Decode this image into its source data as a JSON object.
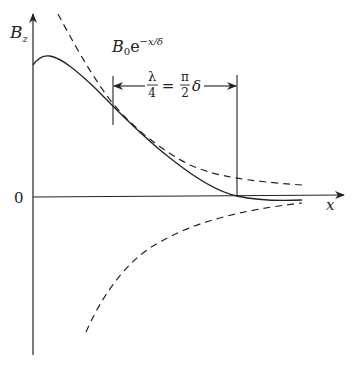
{
  "diagram": {
    "y_axis_label": "B",
    "y_axis_sub": "z",
    "x_axis_label": "x",
    "origin_label": "0",
    "envelope_label": {
      "base": "B",
      "sub": "0",
      "e": "e",
      "exp": "−x/δ"
    },
    "span_label": {
      "lhs_num": "λ",
      "lhs_den": "4",
      "eq": "=",
      "rhs_num": "π",
      "rhs_den": "2",
      "rhs_tail": "δ"
    },
    "colors": {
      "line": "#222222",
      "background": "#ffffff"
    }
  }
}
